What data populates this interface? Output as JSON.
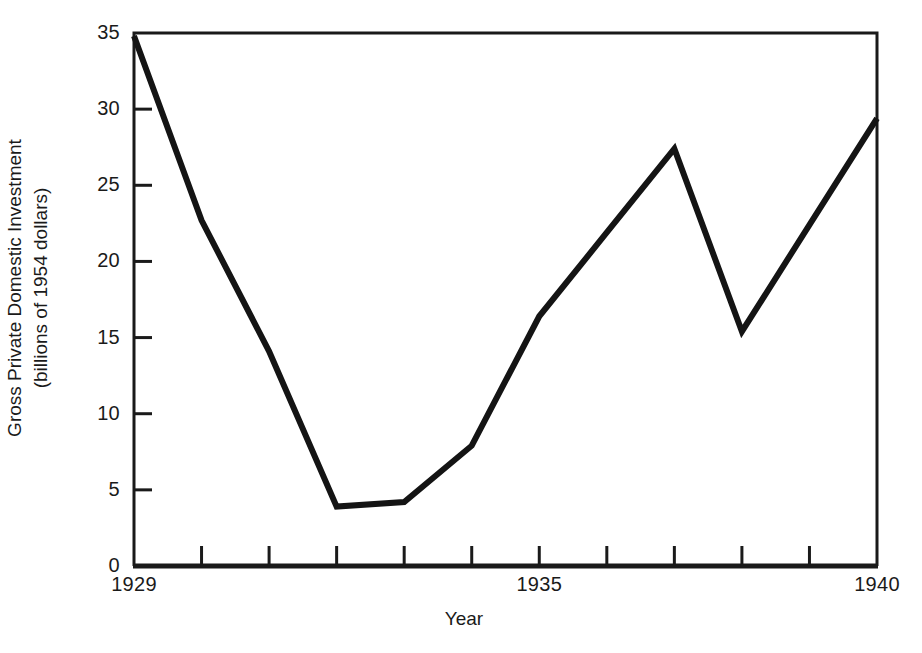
{
  "chart_data": {
    "type": "line",
    "title": "",
    "xlabel": "Year",
    "ylabel": "Gross Private Domestic Investment (billions of 1954 dollars)",
    "ylabel_line1": "Gross Private Domestic Investment",
    "ylabel_line2": "(billions of 1954 dollars)",
    "x": [
      1929,
      1930,
      1931,
      1932,
      1933,
      1934,
      1935,
      1936,
      1937,
      1938,
      1939,
      1940
    ],
    "values": [
      34.8,
      22.7,
      14.1,
      3.9,
      4.2,
      7.9,
      16.4,
      21.9,
      27.4,
      15.4,
      22.4,
      29.4
    ],
    "series": [
      {
        "name": "Gross Private Domestic Investment",
        "values": [
          34.8,
          22.7,
          14.1,
          3.9,
          4.2,
          7.9,
          16.4,
          21.9,
          27.4,
          15.4,
          22.4,
          29.4
        ]
      }
    ],
    "xlim": [
      1929,
      1940
    ],
    "ylim": [
      0,
      35
    ],
    "yticks": [
      0,
      5,
      10,
      15,
      20,
      25,
      30,
      35
    ],
    "ytick_labels": [
      "0",
      "5",
      "10",
      "15",
      "20",
      "25",
      "30",
      "35"
    ],
    "xticks": [
      1929,
      1930,
      1931,
      1932,
      1933,
      1934,
      1935,
      1936,
      1937,
      1938,
      1939,
      1940
    ],
    "xtick_labels_shown": [
      {
        "value": 1929,
        "label": "1929"
      },
      {
        "value": 1935,
        "label": "1935"
      },
      {
        "value": 1940,
        "label": "1940"
      }
    ],
    "grid": false,
    "legend": false,
    "legend_position": "none",
    "line_color": "#141414",
    "line_width_px": 6,
    "frame_color": "#1a1a1a",
    "background_color": "#ffffff",
    "annotations": []
  }
}
